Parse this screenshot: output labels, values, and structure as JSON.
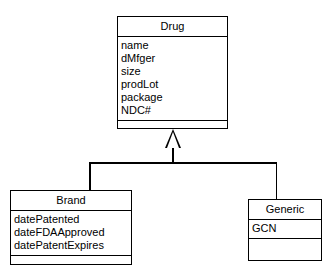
{
  "diagram": {
    "type": "uml-class-diagram",
    "background_color": "#ffffff",
    "line_color": "#000000",
    "relationship": {
      "kind": "generalization",
      "label": "",
      "parent": "Drug",
      "children": [
        "Brand",
        "Generic"
      ],
      "arrowhead": "hollow-triangle"
    }
  },
  "classes": {
    "drug": {
      "name": "Drug",
      "attributes": [
        "name",
        "dMfger",
        "size",
        "prodLot",
        "package",
        "NDC#"
      ],
      "operations": []
    },
    "brand": {
      "name": "Brand",
      "attributes": [
        "datePatented",
        "dateFDAApproved",
        "datePatentExpires"
      ],
      "operations": []
    },
    "generic": {
      "name": "Generic",
      "attributes": [
        "GCN"
      ],
      "operations": []
    }
  }
}
